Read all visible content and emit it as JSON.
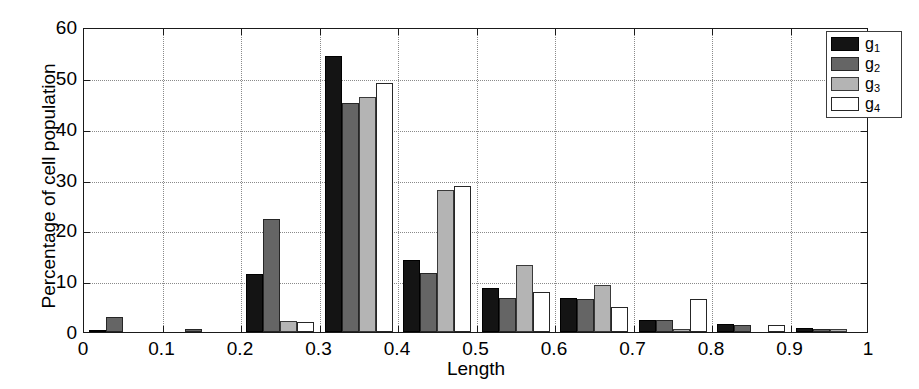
{
  "chart_data": {
    "type": "bar",
    "title": "",
    "xlabel": "Length",
    "ylabel": "Percentage of cell population",
    "xlim": [
      0,
      1
    ],
    "ylim": [
      0,
      60
    ],
    "yticks": [
      0,
      10,
      20,
      30,
      40,
      50,
      60
    ],
    "ytick_labels": [
      "0",
      "10",
      "20",
      "30",
      "40",
      "50",
      "60"
    ],
    "xticks": [
      0,
      0.1,
      0.2,
      0.3,
      0.4,
      0.5,
      0.6,
      0.7,
      0.8,
      0.9,
      1
    ],
    "xtick_labels": [
      "0",
      "0.1",
      "0.2",
      "0.3",
      "0.4",
      "0.5",
      "0.6",
      "0.7",
      "0.8",
      "0.9",
      "1"
    ],
    "grid": true,
    "grid_style": "dotted",
    "legend_position": "top-right",
    "bin_centers": [
      0.05,
      0.15,
      0.25,
      0.35,
      0.45,
      0.55,
      0.65,
      0.75,
      0.85,
      0.95
    ],
    "bin_edges": [
      0.0,
      0.1,
      0.2,
      0.3,
      0.4,
      0.5,
      0.6,
      0.7,
      0.8,
      0.9,
      1.0
    ],
    "series": [
      {
        "name": "g1",
        "label": "g",
        "subscript": "1",
        "color": "#141414",
        "values": [
          0.4,
          0.0,
          11.5,
          54.2,
          14.2,
          8.7,
          6.7,
          2.4,
          1.5,
          0.7
        ]
      },
      {
        "name": "g2",
        "label": "g",
        "subscript": "2",
        "color": "#656565",
        "values": [
          2.9,
          0.6,
          22.3,
          45.0,
          11.6,
          6.6,
          6.5,
          2.3,
          1.4,
          0.6
        ]
      },
      {
        "name": "g3",
        "label": "g",
        "subscript": "3",
        "color": "#b4b4b4",
        "values": [
          0.0,
          0.0,
          2.2,
          46.2,
          27.9,
          13.2,
          9.2,
          0.5,
          0.0,
          0.5
        ]
      },
      {
        "name": "g4",
        "label": "g",
        "subscript": "4",
        "color": "#ffffff",
        "values": [
          0.0,
          0.0,
          2.0,
          48.9,
          28.8,
          7.8,
          5.0,
          6.5,
          1.4,
          0.0
        ]
      }
    ]
  },
  "legend": {
    "entries": [
      {
        "label": "g",
        "subscript": "1"
      },
      {
        "label": "g",
        "subscript": "2"
      },
      {
        "label": "g",
        "subscript": "3"
      },
      {
        "label": "g",
        "subscript": "4"
      }
    ]
  },
  "axes": {
    "y_title": "Percentage of cell population",
    "x_title": "Length"
  }
}
